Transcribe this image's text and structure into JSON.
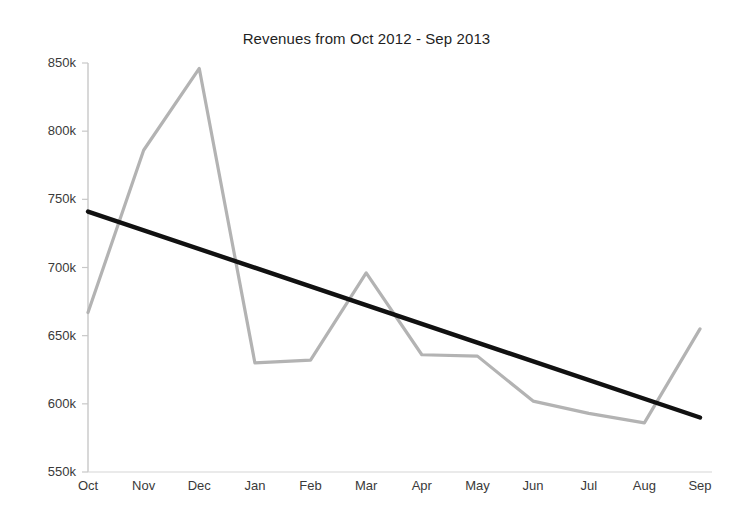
{
  "chart_data": {
    "type": "line",
    "title": "Revenues from Oct 2012 - Sep 2013",
    "xlabel": "",
    "ylabel": "",
    "categories": [
      "Oct",
      "Nov",
      "Dec",
      "Jan",
      "Feb",
      "Mar",
      "Apr",
      "May",
      "Jun",
      "Jul",
      "Aug",
      "Sep"
    ],
    "ylim": [
      550000,
      850000
    ],
    "ytick_values": [
      550000,
      600000,
      650000,
      700000,
      750000,
      800000,
      850000
    ],
    "ytick_labels": [
      "550k",
      "600k",
      "650k",
      "700k",
      "750k",
      "800k",
      "850k"
    ],
    "grid": false,
    "legend": "none",
    "series": [
      {
        "name": "Revenues",
        "type": "line",
        "color": "#b3b3b3",
        "values": [
          667000,
          786000,
          846000,
          630000,
          632000,
          696000,
          636000,
          635000,
          602000,
          593000,
          586000,
          655000
        ]
      },
      {
        "name": "Trend",
        "type": "trendline",
        "color": "#111111",
        "values": [
          741000,
          727000,
          714000,
          700000,
          686000,
          672000,
          659000,
          645000,
          631000,
          617000,
          604000,
          590000
        ]
      }
    ]
  },
  "axes": {
    "y_axis_color": "#c8c8c8",
    "x_axis_color": "#d2d2d2",
    "tick_color": "#c8c8c8"
  }
}
